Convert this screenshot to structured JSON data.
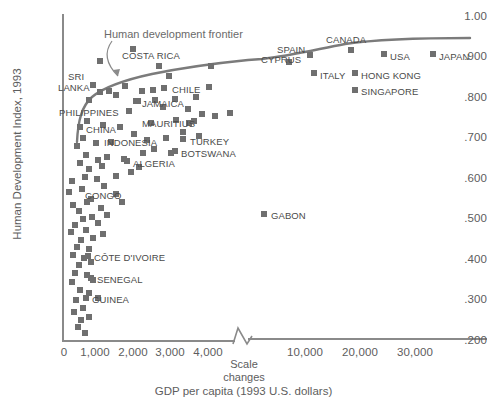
{
  "chart_data": {
    "type": "scatter",
    "title": "",
    "xlabel": "GDP per capita (1993 U.S. dollars)",
    "ylabel": "Human Development Index, 1993",
    "y_ticks": [
      "1.00",
      ".900",
      ".800",
      ".700",
      ".600",
      ".500",
      ".400",
      ".300",
      ".200"
    ],
    "y_tick_values": [
      1.0,
      0.9,
      0.8,
      0.7,
      0.6,
      0.5,
      0.4,
      0.3,
      0.2
    ],
    "ylim": [
      0.2,
      1.0
    ],
    "x_ticks_segment1": [
      "0",
      "1,000",
      "2,000",
      "3,000",
      "4,000"
    ],
    "x_ticks_segment2": [
      "10,000",
      "20,000",
      "30,000"
    ],
    "axis_break_note": "Scale\nchanges",
    "axis_break_line1": "Scale",
    "axis_break_line2": "changes",
    "grid": false,
    "legend": false,
    "annotations": [
      {
        "text": "Human development frontier",
        "kind": "curve-label"
      }
    ],
    "frontier_label": "Human development frontier",
    "labeled_points": [
      {
        "label": "SRI LANKA",
        "gdp": 600,
        "hdi": 0.8
      },
      {
        "label": "PHILIPPINES",
        "gdp": 800,
        "hdi": 0.795
      },
      {
        "label": "CHINA",
        "gdp": 500,
        "hdi": 0.735
      },
      {
        "label": "INDONESIA",
        "gdp": 850,
        "hdi": 0.7
      },
      {
        "label": "COSTA RICA",
        "gdp": 2800,
        "hdi": 0.862
      },
      {
        "label": "JAMAICA",
        "gdp": 1900,
        "hdi": 0.8
      },
      {
        "label": "MAURITIUS",
        "gdp": 3000,
        "hdi": 0.775
      },
      {
        "label": "TURKEY",
        "gdp": 3800,
        "hdi": 0.715
      },
      {
        "label": "ALGERIA",
        "gdp": 2500,
        "hdi": 0.675
      },
      {
        "label": "BOTSWANA",
        "gdp": 3900,
        "hdi": 0.695
      },
      {
        "label": "CHILE",
        "gdp": 5200,
        "hdi": 0.845
      },
      {
        "label": "CONGO",
        "gdp": 1250,
        "hdi": 0.545
      },
      {
        "label": "GABON",
        "gdp": 5500,
        "hdi": 0.525
      },
      {
        "label": "CÔTE D'IVOIRE",
        "gdp": 1100,
        "hdi": 0.415
      },
      {
        "label": "SENEGAL",
        "gdp": 1300,
        "hdi": 0.36
      },
      {
        "label": "GUINEA",
        "gdp": 1150,
        "hdi": 0.31
      },
      {
        "label": "CYPRUS",
        "gdp": 9500,
        "hdi": 0.885
      },
      {
        "label": "SPAIN",
        "gdp": 11500,
        "hdi": 0.915
      },
      {
        "label": "ITALY",
        "gdp": 14500,
        "hdi": 0.89
      },
      {
        "label": "CANADA",
        "gdp": 16500,
        "hdi": 0.932
      },
      {
        "label": "HONG KONG",
        "gdp": 19000,
        "hdi": 0.9
      },
      {
        "label": "SINGAPORE",
        "gdp": 19500,
        "hdi": 0.88
      },
      {
        "label": "USA",
        "gdp": 23000,
        "hdi": 0.925
      },
      {
        "label": "JAPAN",
        "gdp": 30500,
        "hdi": 0.925
      }
    ]
  },
  "colors": {
    "marker": "#6f6f6f",
    "axis": "#8a8a8a",
    "frontier": "#7a7a7a",
    "text": "#5a5a5a"
  },
  "labels": {
    "y_axis_title": "Human Development Index, 1993",
    "x_axis_title": "GDP per capita (1993 U.S. dollars)",
    "frontier": "Human development frontier",
    "scale_line1": "Scale",
    "scale_line2": "changes",
    "y_1_00": "1.00",
    "y_0_900": ".900",
    "y_0_800": ".800",
    "y_0_700": ".700",
    "y_0_600": ".600",
    "y_0_500": ".500",
    "y_0_400": ".400",
    "y_0_300": ".300",
    "y_0_200": ".200",
    "x_0": "0",
    "x_1000": "1,000",
    "x_2000": "2,000",
    "x_3000": "3,000",
    "x_4000": "4,000",
    "x_10000": "10,000",
    "x_20000": "20,000",
    "x_30000": "30,000",
    "p_sri": "SRI",
    "p_lanka": "LANKA",
    "p_philippines": "PHILIPPINES",
    "p_china": "CHINA",
    "p_indonesia": "INDONESIA",
    "p_costa_rica": "COSTA RICA",
    "p_jamaica": "JAMAICA",
    "p_mauritius": "MAURITIUS",
    "p_turkey": "TURKEY",
    "p_algeria": "ALGERIA",
    "p_botswana": "BOTSWANA",
    "p_chile": "CHILE",
    "p_congo": "CONGO",
    "p_gabon": "GABON",
    "p_cote": "CÔTE D'IVOIRE",
    "p_senegal": "SENEGAL",
    "p_guinea": "GUINEA",
    "p_cyprus": "CYPRUS",
    "p_spain": "SPAIN",
    "p_italy": "ITALY",
    "p_canada": "CANADA",
    "p_hongkong": "HONG KONG",
    "p_singapore": "SINGAPORE",
    "p_usa": "USA",
    "p_japan": "JAPAN"
  },
  "marker_positions": [
    {
      "x": 97,
      "y": 58
    },
    {
      "x": 130,
      "y": 46
    },
    {
      "x": 208,
      "y": 63
    },
    {
      "x": 166,
      "y": 73
    },
    {
      "x": 122,
      "y": 83
    },
    {
      "x": 139,
      "y": 88
    },
    {
      "x": 150,
      "y": 87
    },
    {
      "x": 161,
      "y": 85
    },
    {
      "x": 90,
      "y": 82
    },
    {
      "x": 97,
      "y": 89
    },
    {
      "x": 106,
      "y": 88
    },
    {
      "x": 113,
      "y": 92
    },
    {
      "x": 135,
      "y": 98
    },
    {
      "x": 152,
      "y": 97
    },
    {
      "x": 172,
      "y": 96
    },
    {
      "x": 193,
      "y": 94
    },
    {
      "x": 126,
      "y": 108
    },
    {
      "x": 160,
      "y": 104
    },
    {
      "x": 185,
      "y": 106
    },
    {
      "x": 199,
      "y": 111
    },
    {
      "x": 212,
      "y": 113
    },
    {
      "x": 227,
      "y": 110
    },
    {
      "x": 84,
      "y": 118
    },
    {
      "x": 100,
      "y": 122
    },
    {
      "x": 117,
      "y": 124
    },
    {
      "x": 148,
      "y": 120
    },
    {
      "x": 173,
      "y": 117
    },
    {
      "x": 186,
      "y": 120
    },
    {
      "x": 80,
      "y": 135
    },
    {
      "x": 93,
      "y": 140
    },
    {
      "x": 108,
      "y": 139
    },
    {
      "x": 131,
      "y": 131
    },
    {
      "x": 144,
      "y": 137
    },
    {
      "x": 163,
      "y": 135
    },
    {
      "x": 180,
      "y": 129
    },
    {
      "x": 196,
      "y": 133
    },
    {
      "x": 74,
      "y": 143
    },
    {
      "x": 83,
      "y": 152
    },
    {
      "x": 95,
      "y": 157
    },
    {
      "x": 104,
      "y": 154
    },
    {
      "x": 140,
      "y": 150
    },
    {
      "x": 151,
      "y": 146
    },
    {
      "x": 168,
      "y": 150
    },
    {
      "x": 77,
      "y": 160
    },
    {
      "x": 86,
      "y": 166
    },
    {
      "x": 99,
      "y": 163
    },
    {
      "x": 121,
      "y": 156
    },
    {
      "x": 136,
      "y": 164
    },
    {
      "x": 69,
      "y": 178
    },
    {
      "x": 82,
      "y": 174
    },
    {
      "x": 94,
      "y": 176
    },
    {
      "x": 113,
      "y": 173
    },
    {
      "x": 128,
      "y": 169
    },
    {
      "x": 66,
      "y": 189
    },
    {
      "x": 79,
      "y": 186
    },
    {
      "x": 101,
      "y": 183
    },
    {
      "x": 88,
      "y": 196
    },
    {
      "x": 113,
      "y": 191
    },
    {
      "x": 70,
      "y": 202
    },
    {
      "x": 84,
      "y": 199
    },
    {
      "x": 76,
      "y": 208
    },
    {
      "x": 98,
      "y": 205
    },
    {
      "x": 119,
      "y": 199
    },
    {
      "x": 80,
      "y": 216
    },
    {
      "x": 89,
      "y": 214
    },
    {
      "x": 104,
      "y": 212
    },
    {
      "x": 72,
      "y": 222
    },
    {
      "x": 95,
      "y": 220
    },
    {
      "x": 68,
      "y": 229
    },
    {
      "x": 83,
      "y": 227
    },
    {
      "x": 100,
      "y": 231
    },
    {
      "x": 78,
      "y": 237
    },
    {
      "x": 90,
      "y": 235
    },
    {
      "x": 74,
      "y": 244
    },
    {
      "x": 86,
      "y": 246
    },
    {
      "x": 70,
      "y": 252
    },
    {
      "x": 81,
      "y": 255
    },
    {
      "x": 76,
      "y": 262
    },
    {
      "x": 88,
      "y": 259
    },
    {
      "x": 72,
      "y": 270
    },
    {
      "x": 84,
      "y": 272
    },
    {
      "x": 69,
      "y": 279
    },
    {
      "x": 90,
      "y": 277
    },
    {
      "x": 77,
      "y": 287
    },
    {
      "x": 86,
      "y": 290
    },
    {
      "x": 73,
      "y": 297
    },
    {
      "x": 95,
      "y": 295
    },
    {
      "x": 80,
      "y": 305
    },
    {
      "x": 71,
      "y": 309
    },
    {
      "x": 78,
      "y": 317
    },
    {
      "x": 86,
      "y": 314
    },
    {
      "x": 75,
      "y": 324
    },
    {
      "x": 82,
      "y": 330
    }
  ]
}
